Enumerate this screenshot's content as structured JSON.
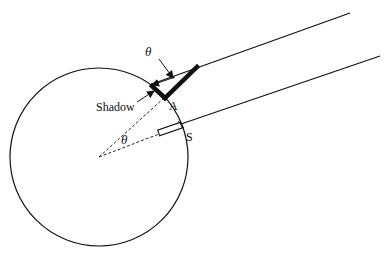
{
  "diagram": {
    "labels": {
      "theta_top": "θ",
      "theta_center": "θ",
      "shadow": "Shadow",
      "point_a": "A",
      "point_s": "S"
    },
    "colors": {
      "stroke": "#111111",
      "background": "#ffffff"
    },
    "elements": [
      {
        "name": "earth-circle",
        "type": "circle",
        "cx": 99,
        "cy": 157,
        "r": 89
      },
      {
        "name": "sun-ray-upper",
        "type": "line",
        "from": [
          152,
          84
        ],
        "to": [
          350,
          13
        ]
      },
      {
        "name": "sun-ray-lower",
        "type": "line",
        "from": [
          181,
          124
        ],
        "to": [
          380,
          56
        ]
      },
      {
        "name": "gnomon-stick",
        "type": "thick-line",
        "from": [
          196,
          68
        ],
        "to": [
          165,
          98
        ]
      },
      {
        "name": "gnomon-shadow",
        "type": "thick-line",
        "from": [
          165,
          98
        ],
        "to": [
          152,
          85
        ]
      },
      {
        "name": "well-at-s",
        "type": "rectangle",
        "at": [
          170,
          129
        ]
      },
      {
        "name": "radius-to-a",
        "type": "dashed-line",
        "from": [
          99,
          157
        ],
        "to": [
          164,
          98
        ]
      },
      {
        "name": "radius-to-s",
        "type": "dashed-line",
        "from": [
          99,
          157
        ],
        "to": [
          159,
          134
        ]
      }
    ]
  }
}
